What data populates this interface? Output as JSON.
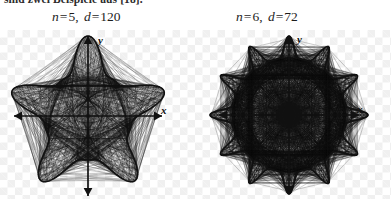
{
  "document": {
    "caption_fragment": "sind zwei Beispiele aus [18].",
    "background": "transparency-checkerboard",
    "page_bg": "#ffffff",
    "ink_color": "#111111",
    "checker_color": "#f0f0f0"
  },
  "figures": [
    {
      "id": "figure-left",
      "label": {
        "n_var": "n",
        "n_eq": "=",
        "n_val": "5",
        "comma": ",",
        "d_var": "d",
        "d_eq": "=",
        "d_val": "120"
      },
      "label_text": "n = 5, d = 120",
      "axes": {
        "x_label": "x",
        "y_label": "y"
      },
      "curve": {
        "type": "string-art-envelope",
        "points": 5,
        "n": 5,
        "d": 120,
        "description": "five-pointed star rosette with concave sides"
      }
    },
    {
      "id": "figure-right",
      "label": {
        "n_var": "n",
        "n_eq": "=",
        "n_val": "6",
        "comma": ",",
        "d_var": "d",
        "d_eq": "=",
        "d_val": "72"
      },
      "label_text": "n = 6, d = 72",
      "axes": {
        "x_label": "x",
        "y_label": "y"
      },
      "curve": {
        "type": "string-art-envelope",
        "points": 12,
        "n": 6,
        "d": 72,
        "description": "twelve-pointed dense star rosette"
      }
    }
  ],
  "chart_data": {
    "type": "line",
    "title": "",
    "xlabel": "x",
    "ylabel": "y",
    "series": [
      {
        "name": "n = 5, d = 120",
        "points": 5,
        "n": 5,
        "d": 120,
        "description": "5-pointed star envelope curve, concave edges, axes shown as double arrows through origin"
      },
      {
        "name": "n = 6, d = 72",
        "points": 12,
        "n": 6,
        "d": 72,
        "description": "12-pointed dense star rosette, axes shown as double arrows through origin"
      }
    ],
    "grid": false,
    "legend": "none"
  }
}
